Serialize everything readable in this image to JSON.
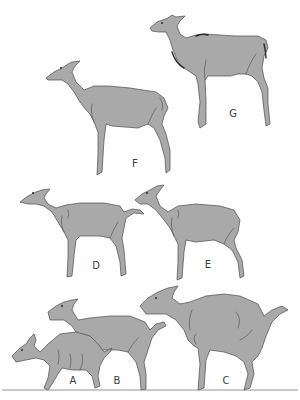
{
  "figure": {
    "fill_color": "#a9a9a9",
    "outline_color": "#4a4a4a",
    "background": "#fefefe",
    "panels": [
      {
        "id": "G",
        "label": "G",
        "label_x": 233,
        "label_y": 113
      },
      {
        "id": "F",
        "label": "F",
        "label_x": 135,
        "label_y": 163
      },
      {
        "id": "D",
        "label": "D",
        "label_x": 96,
        "label_y": 265
      },
      {
        "id": "E",
        "label": "E",
        "label_x": 208,
        "label_y": 264
      },
      {
        "id": "A",
        "label": "A",
        "label_x": 73,
        "label_y": 380
      },
      {
        "id": "B",
        "label": "B",
        "label_x": 117,
        "label_y": 380
      },
      {
        "id": "C",
        "label": "C",
        "label_x": 226,
        "label_y": 380
      }
    ]
  }
}
